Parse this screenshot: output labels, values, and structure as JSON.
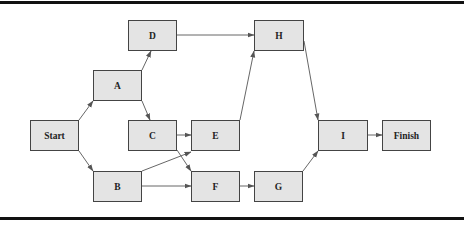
{
  "diagram": {
    "type": "network-activity-diagram",
    "nodes": [
      {
        "id": "start",
        "label": "Start",
        "x": 30,
        "y": 120,
        "w": 49,
        "h": 31
      },
      {
        "id": "a",
        "label": "A",
        "x": 93,
        "y": 70,
        "w": 49,
        "h": 31
      },
      {
        "id": "b",
        "label": "B",
        "x": 93,
        "y": 171,
        "w": 49,
        "h": 31
      },
      {
        "id": "c",
        "label": "C",
        "x": 128,
        "y": 120,
        "w": 49,
        "h": 31
      },
      {
        "id": "d",
        "label": "D",
        "x": 128,
        "y": 20,
        "w": 49,
        "h": 31
      },
      {
        "id": "e",
        "label": "E",
        "x": 191,
        "y": 120,
        "w": 49,
        "h": 31
      },
      {
        "id": "f",
        "label": "F",
        "x": 191,
        "y": 171,
        "w": 49,
        "h": 31
      },
      {
        "id": "g",
        "label": "G",
        "x": 254,
        "y": 171,
        "w": 49,
        "h": 31
      },
      {
        "id": "h",
        "label": "H",
        "x": 254,
        "y": 20,
        "w": 50,
        "h": 31
      },
      {
        "id": "i",
        "label": "I",
        "x": 318,
        "y": 120,
        "w": 50,
        "h": 31
      },
      {
        "id": "finish",
        "label": "Finish",
        "x": 382,
        "y": 120,
        "w": 49,
        "h": 31
      }
    ],
    "edges": [
      {
        "from": "Start",
        "to": "A"
      },
      {
        "from": "Start",
        "to": "B"
      },
      {
        "from": "A",
        "to": "D"
      },
      {
        "from": "A",
        "to": "C"
      },
      {
        "from": "D",
        "to": "H"
      },
      {
        "from": "C",
        "to": "E"
      },
      {
        "from": "C",
        "to": "F"
      },
      {
        "from": "B",
        "to": "E"
      },
      {
        "from": "B",
        "to": "F"
      },
      {
        "from": "E",
        "to": "H"
      },
      {
        "from": "F",
        "to": "G"
      },
      {
        "from": "H",
        "to": "I"
      },
      {
        "from": "G",
        "to": "I"
      },
      {
        "from": "I",
        "to": "Finish"
      }
    ],
    "colors": {
      "node_fill": "#e4e4e4",
      "node_border": "#444444",
      "edge": "#555555",
      "rule": "#111111"
    }
  }
}
